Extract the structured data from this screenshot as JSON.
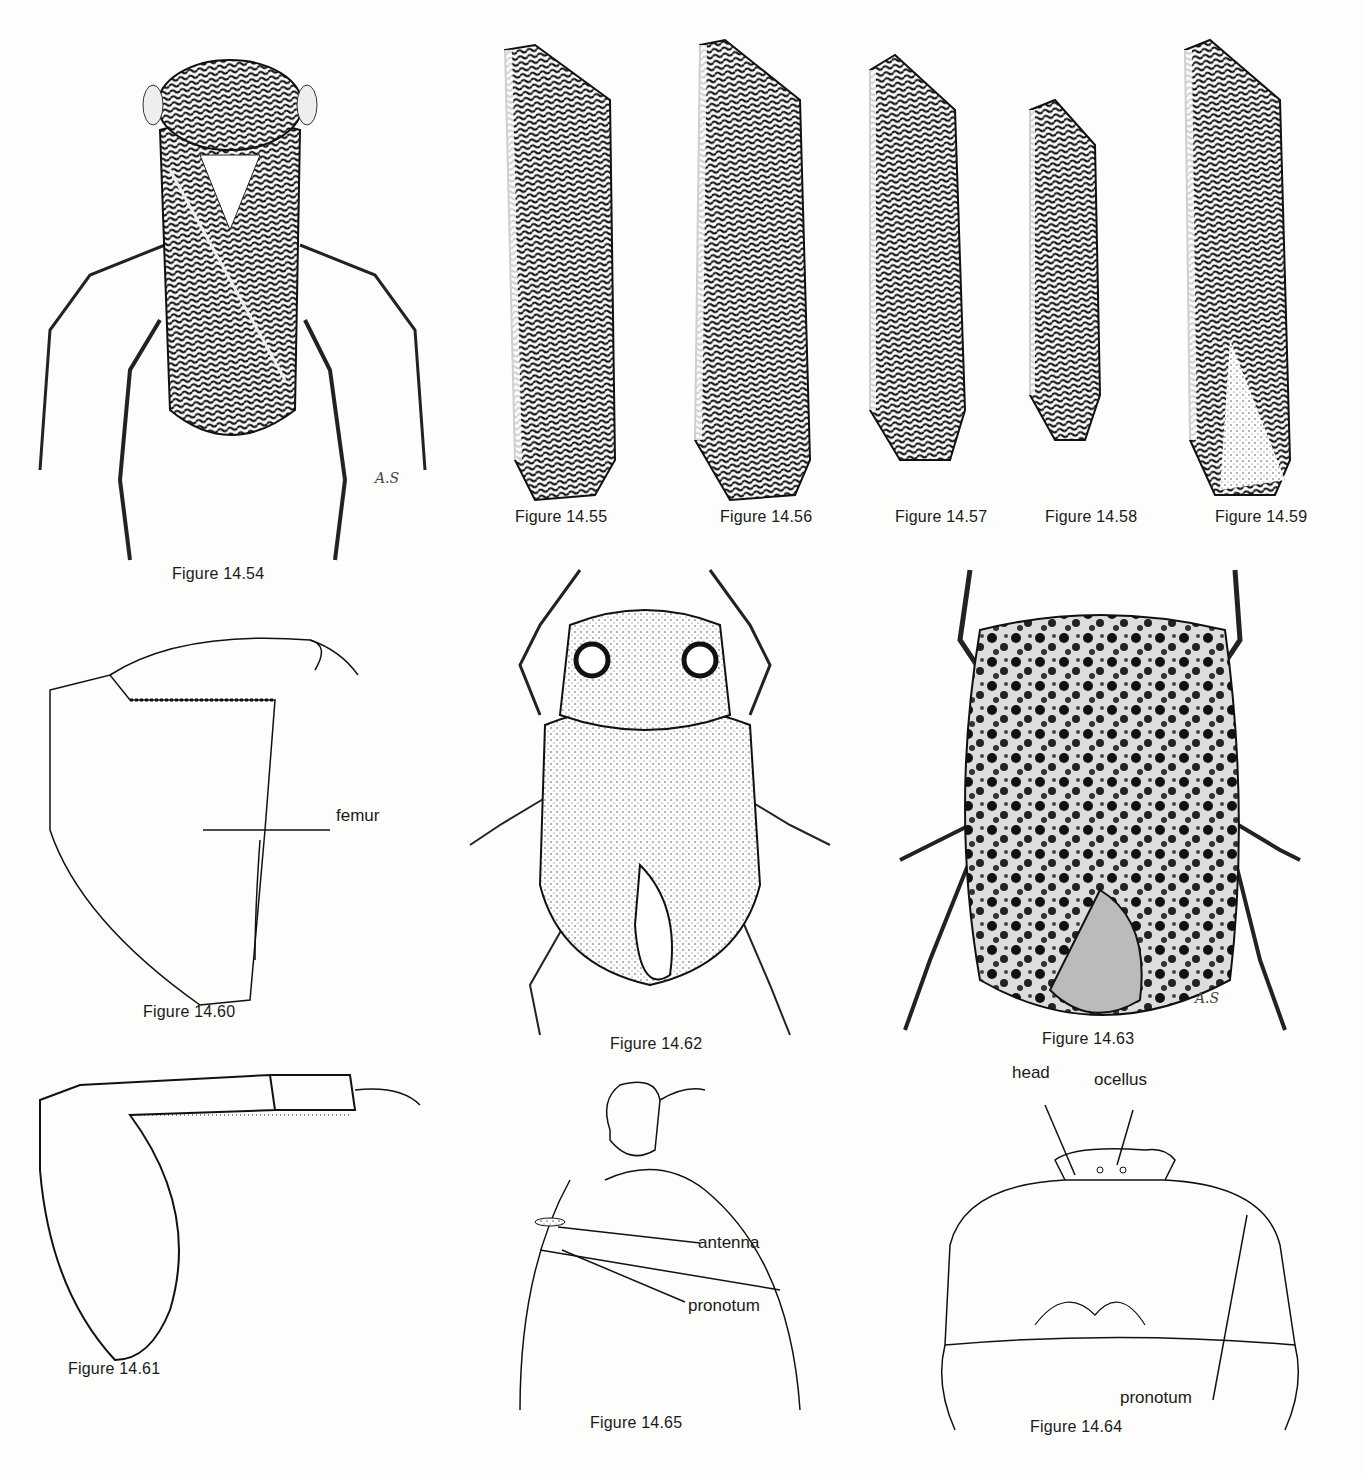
{
  "plate": {
    "figures": [
      {
        "id": "14.54",
        "caption": "Figure 14.54",
        "subject": "whole insect, dorsal view (water bug with striated pronotum and patterned wings)",
        "signature": "A.S"
      },
      {
        "id": "14.55",
        "caption": "Figure 14.55",
        "subject": "forewing (hemelytron) pattern"
      },
      {
        "id": "14.56",
        "caption": "Figure 14.56",
        "subject": "forewing (hemelytron) pattern"
      },
      {
        "id": "14.57",
        "caption": "Figure 14.57",
        "subject": "forewing (hemelytron) pattern"
      },
      {
        "id": "14.58",
        "caption": "Figure 14.58",
        "subject": "forewing (hemelytron) pattern"
      },
      {
        "id": "14.59",
        "caption": "Figure 14.59",
        "subject": "forewing (hemelytron) pattern"
      },
      {
        "id": "14.60",
        "caption": "Figure 14.60",
        "subject": "raptorial foreleg outline",
        "labels": [
          "femur"
        ]
      },
      {
        "id": "14.61",
        "caption": "Figure 14.61",
        "subject": "foreleg outline with setae"
      },
      {
        "id": "14.62",
        "caption": "Figure 14.62",
        "subject": "whole insect, dorsal view (stippled)"
      },
      {
        "id": "14.63",
        "caption": "Figure 14.63",
        "subject": "whole insect, dorsal view (mottled)",
        "signature": "A.S"
      },
      {
        "id": "14.64",
        "caption": "Figure 14.64",
        "subject": "head and pronotum outline",
        "labels": [
          "head",
          "ocellus",
          "pronotum"
        ]
      },
      {
        "id": "14.65",
        "caption": "Figure 14.65",
        "subject": "eye, antenna and pronotum outline, lateral",
        "labels": [
          "antenna",
          "pronotum"
        ]
      }
    ]
  },
  "captions": {
    "f54": "Figure 14.54",
    "f55": "Figure 14.55",
    "f56": "Figure 14.56",
    "f57": "Figure 14.57",
    "f58": "Figure 14.58",
    "f59": "Figure 14.59",
    "f60": "Figure 14.60",
    "f61": "Figure 14.61",
    "f62": "Figure 14.62",
    "f63": "Figure 14.63",
    "f64": "Figure 14.64",
    "f65": "Figure 14.65"
  },
  "labels": {
    "femur": "femur",
    "head": "head",
    "ocellus": "ocellus",
    "pronotum_64": "pronotum",
    "antenna": "antenna",
    "pronotum_65": "pronotum"
  },
  "signatures": {
    "f54": "A.S",
    "f63": "A.S"
  },
  "colors": {
    "ink": "#1a1a1a",
    "paper": "#fdfdfb"
  }
}
